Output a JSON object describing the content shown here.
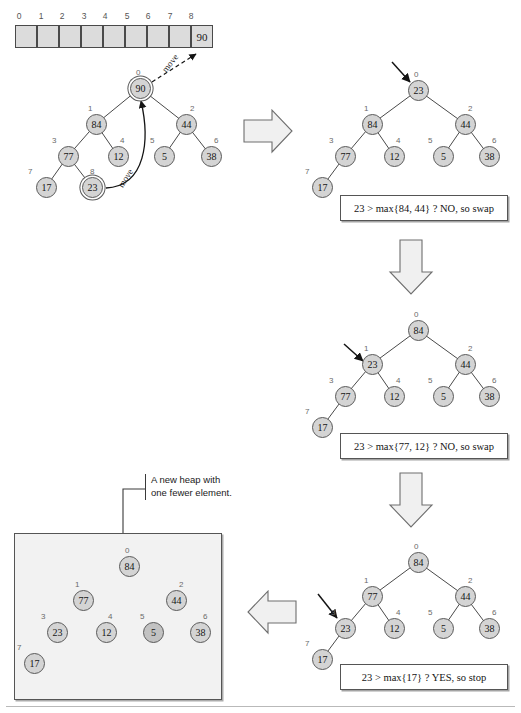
{
  "figure": {
    "footer_rule": true
  },
  "array": {
    "name": "heap-array",
    "indices": [
      "0",
      "1",
      "2",
      "3",
      "4",
      "5",
      "6",
      "7",
      "8"
    ],
    "values": [
      "",
      "",
      "",
      "",
      "",
      "",
      "",
      "",
      "90"
    ],
    "cell_width": 21.5,
    "cell_height": 23
  },
  "move_labels": {
    "out": "move",
    "up": "move"
  },
  "trees": {
    "step0": {
      "label": "initial-heap",
      "nodes": [
        {
          "idx": "0",
          "value": "90",
          "ring": true
        },
        {
          "idx": "1",
          "value": "84",
          "ring": false
        },
        {
          "idx": "2",
          "value": "44",
          "ring": false
        },
        {
          "idx": "3",
          "value": "77",
          "ring": false
        },
        {
          "idx": "4",
          "value": "12",
          "ring": false
        },
        {
          "idx": "5",
          "value": "5",
          "ring": false
        },
        {
          "idx": "6",
          "value": "38",
          "ring": false
        },
        {
          "idx": "7",
          "value": "17",
          "ring": false
        },
        {
          "idx": "8",
          "value": "23",
          "ring": true
        }
      ]
    },
    "step1": {
      "label": "after-move-to-root",
      "caption": "23 > max{84, 44} ? NO, so swap",
      "nodes": [
        {
          "idx": "0",
          "value": "23"
        },
        {
          "idx": "1",
          "value": "84"
        },
        {
          "idx": "2",
          "value": "44"
        },
        {
          "idx": "3",
          "value": "77"
        },
        {
          "idx": "4",
          "value": "12"
        },
        {
          "idx": "5",
          "value": "5"
        },
        {
          "idx": "6",
          "value": "38"
        },
        {
          "idx": "7",
          "value": "17"
        }
      ]
    },
    "step2": {
      "label": "after-first-swap",
      "caption": "23 > max{77, 12} ? NO, so swap",
      "nodes": [
        {
          "idx": "0",
          "value": "84"
        },
        {
          "idx": "1",
          "value": "23"
        },
        {
          "idx": "2",
          "value": "44"
        },
        {
          "idx": "3",
          "value": "77"
        },
        {
          "idx": "4",
          "value": "12"
        },
        {
          "idx": "5",
          "value": "5"
        },
        {
          "idx": "6",
          "value": "38"
        },
        {
          "idx": "7",
          "value": "17"
        }
      ]
    },
    "step3": {
      "label": "after-second-swap",
      "caption": "23 > max{17} ? YES, so stop",
      "nodes": [
        {
          "idx": "0",
          "value": "84"
        },
        {
          "idx": "1",
          "value": "77"
        },
        {
          "idx": "2",
          "value": "44"
        },
        {
          "idx": "3",
          "value": "23"
        },
        {
          "idx": "4",
          "value": "12"
        },
        {
          "idx": "5",
          "value": "5"
        },
        {
          "idx": "6",
          "value": "38"
        },
        {
          "idx": "7",
          "value": "17"
        }
      ]
    },
    "result": {
      "label": "final-heap",
      "nodes": [
        {
          "idx": "0",
          "value": "84"
        },
        {
          "idx": "1",
          "value": "77"
        },
        {
          "idx": "2",
          "value": "44"
        },
        {
          "idx": "3",
          "value": "23"
        },
        {
          "idx": "4",
          "value": "12"
        },
        {
          "idx": "5",
          "value": "5",
          "dark": true
        },
        {
          "idx": "6",
          "value": "38"
        },
        {
          "idx": "7",
          "value": "17"
        }
      ]
    }
  },
  "callout": {
    "line1": "A new heap with",
    "line2": "one fewer element."
  },
  "flow_arrows": [
    {
      "name": "flow-arrow-right-top",
      "direction": "right"
    },
    {
      "name": "flow-arrow-down-1",
      "direction": "down"
    },
    {
      "name": "flow-arrow-down-2",
      "direction": "down"
    },
    {
      "name": "flow-arrow-left-bottom",
      "direction": "left"
    }
  ],
  "pointers": [
    {
      "name": "pointer-arrow-step1",
      "target": "root"
    },
    {
      "name": "pointer-arrow-step2",
      "target": "index-1"
    },
    {
      "name": "pointer-arrow-step3",
      "target": "index-3"
    }
  ],
  "colors": {
    "node_fill": "#d4d4d4",
    "node_stroke": "#5a5a5a",
    "array_fill": "#dcdcdc",
    "box_fill": "#f2f2f2",
    "edge": "#4a4a4a"
  }
}
